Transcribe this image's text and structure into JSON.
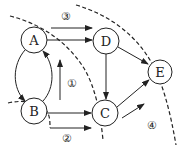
{
  "diagram": {
    "type": "network-flow",
    "nodes": [
      {
        "id": "A",
        "label": "A",
        "x": 34,
        "y": 40
      },
      {
        "id": "B",
        "label": "B",
        "x": 34,
        "y": 111
      },
      {
        "id": "C",
        "label": "C",
        "x": 105,
        "y": 113
      },
      {
        "id": "D",
        "label": "D",
        "x": 106,
        "y": 41
      },
      {
        "id": "E",
        "label": "E",
        "x": 160,
        "y": 72
      }
    ],
    "edges": [
      {
        "from": "A",
        "to": "D"
      },
      {
        "from": "D",
        "to": "C"
      },
      {
        "from": "D",
        "to": "E"
      },
      {
        "from": "A",
        "to": "B"
      },
      {
        "from": "B",
        "to": "A"
      },
      {
        "from": "B",
        "to": "C"
      },
      {
        "from": "C",
        "to": "E"
      }
    ],
    "cut_labels": [
      {
        "id": "1",
        "label": "①"
      },
      {
        "id": "2",
        "label": "②"
      },
      {
        "id": "3",
        "label": "③"
      },
      {
        "id": "4",
        "label": "④"
      }
    ],
    "colors": {
      "stroke": "#222222",
      "background": "#ffffff"
    }
  }
}
